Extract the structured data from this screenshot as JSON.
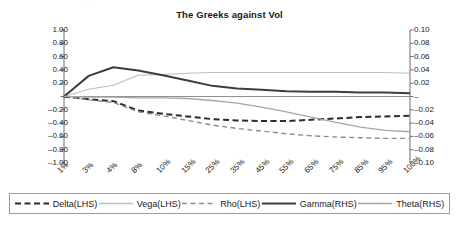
{
  "artifact": {
    "text": "..."
  },
  "chart_data": {
    "type": "line",
    "title": "The Greeks against Vol",
    "xlabel": "",
    "ylabel": "",
    "grid": false,
    "legend_position": "bottom",
    "categories": [
      "1%",
      "3%",
      "4%",
      "8%",
      "10%",
      "15%",
      "25%",
      "35%",
      "45%",
      "55%",
      "65%",
      "75%",
      "85%",
      "95%",
      "100%"
    ],
    "left_axis": {
      "name": "LHS",
      "ylim": [
        -1.0,
        1.0
      ],
      "ticks": [
        "1.00",
        "0.80",
        "0.60",
        "0.40",
        "0.20",
        "–",
        "–0.20",
        "–0.40",
        "–0.60",
        "–0.80",
        "–1.00"
      ],
      "tick_values": [
        1.0,
        0.8,
        0.6,
        0.4,
        0.2,
        0,
        -0.2,
        -0.4,
        -0.6,
        -0.8,
        -1.0
      ]
    },
    "right_axis": {
      "name": "RHS",
      "ylim": [
        -0.1,
        0.1
      ],
      "ticks": [
        "0.10",
        "0.08",
        "0.06",
        "0.04",
        "0.02",
        "–",
        "–0.02",
        "–0.04",
        "–0.06",
        "–0.08",
        "–0.10"
      ],
      "tick_values": [
        0.1,
        0.08,
        0.06,
        0.04,
        0.02,
        0,
        -0.02,
        -0.04,
        -0.06,
        -0.08,
        -0.1
      ]
    },
    "series": [
      {
        "name": "Delta(LHS)",
        "axis": "left",
        "style": "dashed",
        "width": 2.0,
        "color": "#2b2b2b",
        "values": [
          0.0,
          -0.04,
          -0.07,
          -0.21,
          -0.26,
          -0.3,
          -0.34,
          -0.36,
          -0.37,
          -0.37,
          -0.35,
          -0.33,
          -0.31,
          -0.3,
          -0.29
        ]
      },
      {
        "name": "Vega(LHS)",
        "axis": "left",
        "style": "solid",
        "width": 1.1,
        "color": "#bdbdbd",
        "values": [
          0.0,
          0.11,
          0.17,
          0.32,
          0.33,
          0.35,
          0.36,
          0.36,
          0.36,
          0.36,
          0.36,
          0.36,
          0.36,
          0.36,
          0.35
        ]
      },
      {
        "name": "Rho(LHS)",
        "axis": "left",
        "style": "dashed",
        "width": 1.4,
        "color": "#8c8c8c",
        "values": [
          0.0,
          -0.05,
          -0.09,
          -0.23,
          -0.29,
          -0.36,
          -0.43,
          -0.48,
          -0.52,
          -0.56,
          -0.59,
          -0.61,
          -0.62,
          -0.63,
          -0.63
        ]
      },
      {
        "name": "Gamma(RHS)",
        "axis": "right",
        "style": "solid",
        "width": 2.0,
        "color": "#3d3d3d",
        "values": [
          0.0,
          0.031,
          0.044,
          0.039,
          0.032,
          0.024,
          0.016,
          0.012,
          0.01,
          0.008,
          0.007,
          0.007,
          0.006,
          0.006,
          0.005
        ]
      },
      {
        "name": "Theta(RHS)",
        "axis": "right",
        "style": "solid",
        "width": 1.3,
        "color": "#a6a6a6",
        "values": [
          0.0,
          -0.001,
          -0.001,
          -0.002,
          -0.002,
          -0.003,
          -0.006,
          -0.01,
          -0.016,
          -0.023,
          -0.031,
          -0.039,
          -0.046,
          -0.051,
          -0.053
        ]
      }
    ]
  },
  "legend": {
    "items": [
      {
        "label": "Delta(LHS)",
        "style": "dashed",
        "color": "#2b2b2b",
        "width": 2.0
      },
      {
        "label": "Vega(LHS)",
        "style": "solid",
        "color": "#bdbdbd",
        "width": 1.3
      },
      {
        "label": "Rho(LHS)",
        "style": "dashed",
        "color": "#8c8c8c",
        "width": 1.4
      },
      {
        "label": "Gamma(RHS)",
        "style": "solid",
        "color": "#3d3d3d",
        "width": 2.0
      },
      {
        "label": "Theta(RHS)",
        "style": "solid",
        "color": "#a6a6a6",
        "width": 1.3
      }
    ]
  }
}
